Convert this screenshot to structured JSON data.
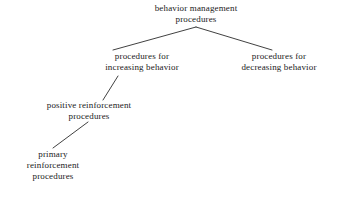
{
  "diagram": {
    "type": "tree",
    "background_color": "#ffffff",
    "line_color": "#2b2b2b",
    "text_color": "#1a1a1a",
    "nodes": [
      {
        "id": "root",
        "lines": [
          "behavior management",
          "procedures"
        ],
        "line1": "behavior management",
        "line2": "procedures",
        "level": 0,
        "center_x": 196,
        "top_y": 3
      },
      {
        "id": "increasing",
        "lines": [
          "procedures for",
          "increasing behavior"
        ],
        "line1": "procedures for",
        "line2": "increasing behavior",
        "level": 1,
        "center_x": 142,
        "top_y": 51
      },
      {
        "id": "decreasing",
        "lines": [
          "procedures for",
          "decreasing behavior"
        ],
        "line1": "procedures for",
        "line2": "decreasing behavior",
        "level": 1,
        "center_x": 279,
        "top_y": 51
      },
      {
        "id": "positive",
        "lines": [
          "positive reinforcement",
          "procedures"
        ],
        "line1": "positive reinforcement",
        "line2": "procedures",
        "level": 2,
        "center_x": 89,
        "top_y": 100
      },
      {
        "id": "primary",
        "lines": [
          "primary",
          "reinforcement",
          "procedures"
        ],
        "line1": "primary",
        "line2": "reinforcement",
        "line3": "procedures",
        "level": 3,
        "center_x": 53,
        "top_y": 149
      }
    ],
    "edges": [
      {
        "id": "root-to-increasing",
        "from": "root",
        "to": "increasing",
        "x1": 196,
        "y1": 27,
        "x2": 113,
        "y2": 50
      },
      {
        "id": "root-to-decreasing",
        "from": "root",
        "to": "decreasing",
        "x1": 196,
        "y1": 27,
        "x2": 272,
        "y2": 50
      },
      {
        "id": "increasing-to-positive",
        "from": "increasing",
        "to": "positive",
        "x1": 118,
        "y1": 76,
        "x2": 103,
        "y2": 100
      },
      {
        "id": "positive-to-primary",
        "from": "positive",
        "to": "primary",
        "x1": 88,
        "y1": 122,
        "x2": 53,
        "y2": 148
      }
    ]
  }
}
